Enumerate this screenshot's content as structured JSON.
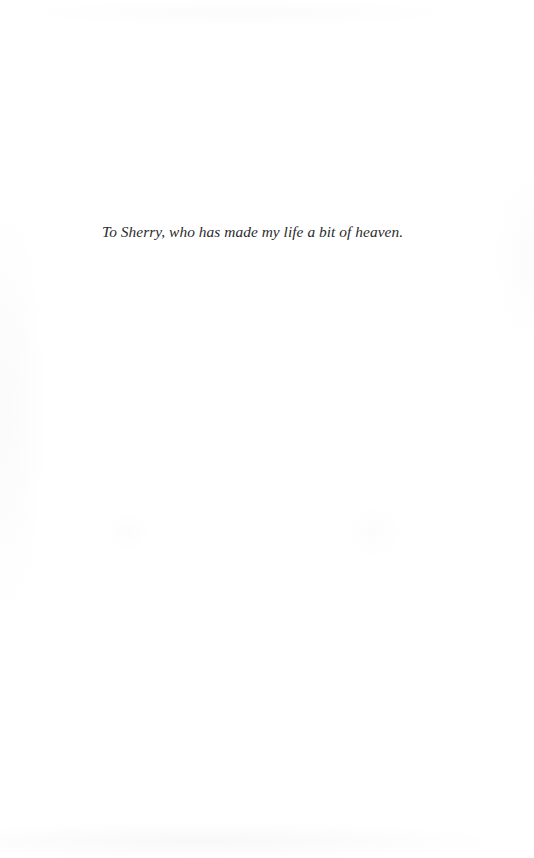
{
  "page": {
    "kind": "book-dedication-page",
    "background_color": "#ffffff",
    "width": 534,
    "height": 858
  },
  "dedication": {
    "text": "To Sherry, who has made my life a bit of heaven.",
    "text_color": "#2b2b2d",
    "style": "italic-serif",
    "alignment": "left"
  }
}
